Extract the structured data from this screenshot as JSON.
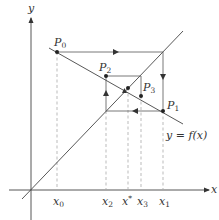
{
  "figure": {
    "axis_labels": {
      "x": "x",
      "y": "y"
    },
    "curve_label": "y = f(x)",
    "line_label": "y = x",
    "points": [
      {
        "name": "P0",
        "base": "P",
        "sub": "0",
        "cx": 57,
        "cy": 52
      },
      {
        "name": "P1",
        "base": "P",
        "sub": "1",
        "cx": 163,
        "cy": 111
      },
      {
        "name": "P2",
        "base": "P",
        "sub": "2",
        "cx": 106,
        "cy": 76
      },
      {
        "name": "P3",
        "base": "P",
        "sub": "3",
        "cx": 141,
        "cy": 96
      },
      {
        "name": "fixed-point",
        "cx": 128,
        "cy": 88
      }
    ],
    "x_ticks": [
      {
        "label": "x0",
        "base": "x",
        "sub": "0",
        "x": 57
      },
      {
        "label": "x2",
        "base": "x",
        "sub": "2",
        "x": 106
      },
      {
        "label": "x*",
        "base": "x",
        "sub": "*",
        "x": 128
      },
      {
        "label": "x3",
        "base": "x",
        "sub": "3",
        "x": 141
      },
      {
        "label": "x1",
        "base": "x",
        "sub": "1",
        "x": 163
      }
    ],
    "colors": {
      "line": "#444444",
      "dash": "#aaaaaa",
      "text": "#333333"
    }
  }
}
